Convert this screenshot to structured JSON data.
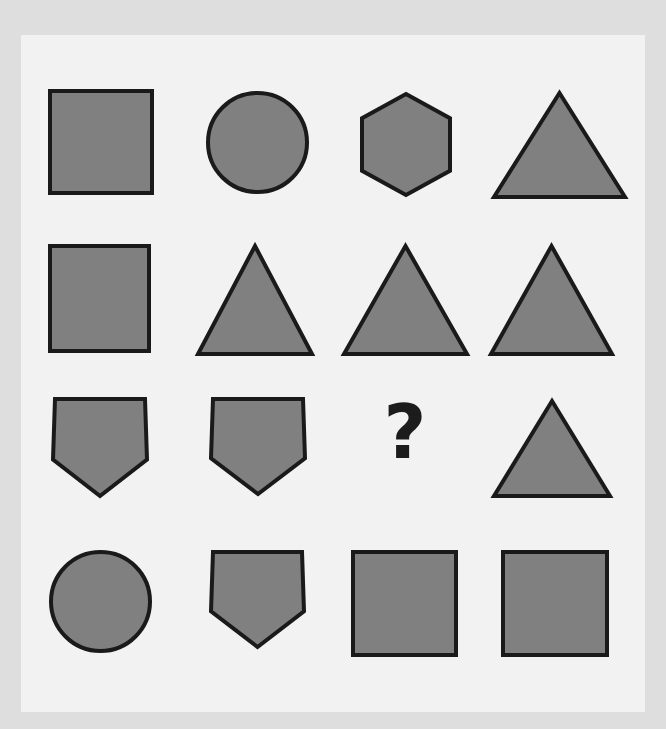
{
  "canvas": {
    "width": 666,
    "height": 729,
    "outer_background": "#dedede",
    "panel_background": "#f2f2f2",
    "panel": {
      "x": 21,
      "y": 35,
      "width": 624,
      "height": 677
    }
  },
  "style": {
    "shape_fill": "#808080",
    "shape_stroke": "#1a1a1a",
    "shape_stroke_width": 4,
    "question_color": "#1c1c1c"
  },
  "puzzle": {
    "type": "matrix-reasoning",
    "rows": 4,
    "cols": 4,
    "missing_cell": {
      "row": 3,
      "col": 3
    },
    "question_text": "?"
  },
  "cells": [
    {
      "id": "r1c1",
      "row": 1,
      "col": 1,
      "shape": "square",
      "label": "square",
      "x": 48,
      "y": 89,
      "width": 106,
      "height": 106
    },
    {
      "id": "r1c2",
      "row": 1,
      "col": 2,
      "shape": "circle",
      "label": "circle",
      "x": 206,
      "y": 91,
      "width": 103,
      "height": 103
    },
    {
      "id": "r1c3",
      "row": 1,
      "col": 3,
      "shape": "hexagon",
      "label": "hexagon",
      "x": 360,
      "y": 92,
      "width": 92,
      "height": 105
    },
    {
      "id": "r1c4",
      "row": 1,
      "col": 4,
      "shape": "triangle",
      "label": "triangle",
      "x": 492,
      "y": 91,
      "width": 135,
      "height": 108
    },
    {
      "id": "r2c1",
      "row": 2,
      "col": 1,
      "shape": "square",
      "label": "square",
      "x": 48,
      "y": 244,
      "width": 103,
      "height": 109
    },
    {
      "id": "r2c2",
      "row": 2,
      "col": 2,
      "shape": "triangle",
      "label": "triangle",
      "x": 196,
      "y": 244,
      "width": 118,
      "height": 112
    },
    {
      "id": "r2c3",
      "row": 2,
      "col": 3,
      "shape": "triangle",
      "label": "triangle",
      "x": 342,
      "y": 244,
      "width": 127,
      "height": 112
    },
    {
      "id": "r2c4",
      "row": 2,
      "col": 4,
      "shape": "triangle",
      "label": "triangle",
      "x": 489,
      "y": 244,
      "width": 125,
      "height": 112
    },
    {
      "id": "r3c1",
      "row": 3,
      "col": 1,
      "shape": "pentagon-inverted",
      "label": "pentagon",
      "x": 51,
      "y": 397,
      "width": 98,
      "height": 101
    },
    {
      "id": "r3c2",
      "row": 3,
      "col": 2,
      "shape": "pentagon-inverted",
      "label": "pentagon",
      "x": 209,
      "y": 397,
      "width": 98,
      "height": 99
    },
    {
      "id": "r3c3",
      "row": 3,
      "col": 3,
      "shape": "question",
      "label": "unknown",
      "x": 380,
      "y": 395,
      "width": 50,
      "height": 88
    },
    {
      "id": "r3c4",
      "row": 3,
      "col": 4,
      "shape": "triangle",
      "label": "triangle",
      "x": 492,
      "y": 399,
      "width": 120,
      "height": 99
    },
    {
      "id": "r4c1",
      "row": 4,
      "col": 1,
      "shape": "circle",
      "label": "circle",
      "x": 49,
      "y": 550,
      "width": 103,
      "height": 103
    },
    {
      "id": "r4c2",
      "row": 4,
      "col": 2,
      "shape": "pentagon-inverted",
      "label": "pentagon",
      "x": 209,
      "y": 550,
      "width": 97,
      "height": 99
    },
    {
      "id": "r4c3",
      "row": 4,
      "col": 3,
      "shape": "square",
      "label": "square",
      "x": 351,
      "y": 550,
      "width": 107,
      "height": 107
    },
    {
      "id": "r4c4",
      "row": 4,
      "col": 4,
      "shape": "square",
      "label": "square",
      "x": 501,
      "y": 550,
      "width": 108,
      "height": 107
    }
  ]
}
